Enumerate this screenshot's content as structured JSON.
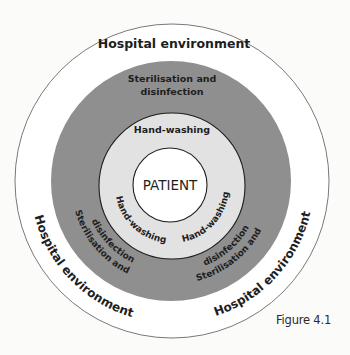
{
  "diagram": {
    "type": "concentric-circles",
    "rings": [
      {
        "name": "Hospital environment",
        "labels": [
          "Hospital environment",
          "Hospital environment",
          "Hospital environment"
        ],
        "fill": "#ffffff"
      },
      {
        "name": "Sterilisation and disinfection",
        "labels": [
          "Sterilisation and",
          "disinfection"
        ],
        "fill": "#8f8f8f"
      },
      {
        "name": "Hand-washing",
        "labels": [
          "Hand-washing",
          "Hand-washing",
          "Hand-washing"
        ],
        "fill": "#e2e2e2"
      },
      {
        "name": "PATIENT",
        "labels": [
          "PATIENT"
        ],
        "fill": "#ffffff"
      }
    ],
    "top": {
      "hospital": "Hospital environment",
      "steril_line1": "Sterilisation and",
      "steril_line2": "disinfection",
      "hand": "Hand-washing"
    },
    "bottom_left": {
      "hospital": "Hospital environment",
      "steril_line1": "Sterilisation and",
      "steril_line2": "disinfection",
      "hand": "Hand-washing"
    },
    "bottom_right": {
      "hospital": "Hospital environment",
      "steril_line1": "Sterilisation and",
      "steril_line2": "disinfection",
      "hand": "Hand-washing"
    },
    "center": "PATIENT",
    "caption": "Figure 4.1"
  }
}
